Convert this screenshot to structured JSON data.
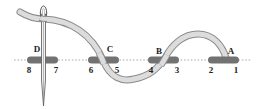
{
  "diagram": {
    "colors": {
      "background": "#ffffff",
      "guideline": "#9a9a9a",
      "stitch_bar": "#6f6f6f",
      "thread_fill": "#d9d9d9",
      "thread_outline": "#8a8a8a",
      "needle": "#555555",
      "text": "#222222"
    },
    "stitches": [
      {
        "letter": "D",
        "left_number": "8",
        "right_number": "7"
      },
      {
        "letter": "C",
        "left_number": "6",
        "right_number": "5"
      },
      {
        "letter": "B",
        "left_number": "4",
        "right_number": "3"
      },
      {
        "letter": "A",
        "left_number": "2",
        "right_number": "1"
      }
    ]
  }
}
